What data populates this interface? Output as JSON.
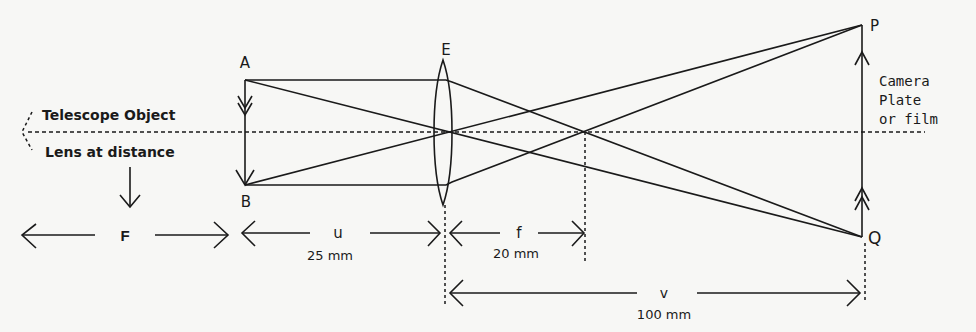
{
  "diagram": {
    "colors": {
      "ink": "#1a1a1a",
      "background": "#f7f7f5"
    },
    "points": {
      "A": "A",
      "B": "B",
      "E": "E",
      "P": "P",
      "Q": "Q"
    },
    "labels": {
      "telescope_object": "Telescope Object",
      "lens_at_distance": "Lens at distance",
      "camera_line1": "Camera",
      "camera_line2": "Plate",
      "camera_line3": "or film"
    },
    "dimensions": {
      "F": {
        "symbol": "F",
        "value": ""
      },
      "u": {
        "symbol": "u",
        "value": "25 mm"
      },
      "f": {
        "symbol": "f",
        "value": "20 mm"
      },
      "v": {
        "symbol": "v",
        "value": "100 mm"
      }
    }
  }
}
